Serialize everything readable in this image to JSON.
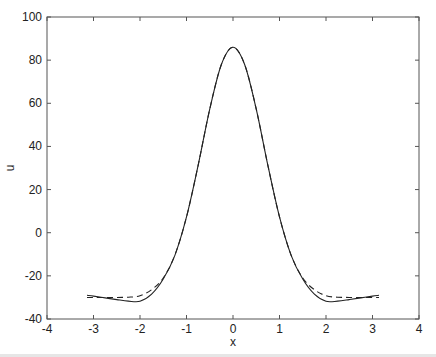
{
  "chart_data": {
    "type": "line",
    "title": "",
    "xlabel": "x",
    "ylabel": "u",
    "xlim": [
      -4,
      4
    ],
    "ylim": [
      -40,
      100
    ],
    "xticks": [
      -4,
      -3,
      -2,
      -1,
      0,
      1,
      2,
      3,
      4
    ],
    "yticks": [
      -40,
      -20,
      0,
      20,
      40,
      60,
      80,
      100
    ],
    "xtick_labels": [
      "-4",
      "-3",
      "-2",
      "-1",
      "0",
      "1",
      "2",
      "3",
      "4"
    ],
    "ytick_labels": [
      "-40",
      "-20",
      "0",
      "20",
      "40",
      "60",
      "80",
      "100"
    ],
    "grid": false,
    "legend": null,
    "x": [
      -3.14,
      -3.0,
      -2.75,
      -2.5,
      -2.25,
      -2.0,
      -1.75,
      -1.5,
      -1.25,
      -1.0,
      -0.75,
      -0.5,
      -0.25,
      0.0,
      0.25,
      0.5,
      0.75,
      1.0,
      1.25,
      1.5,
      1.75,
      2.0,
      2.25,
      2.5,
      2.75,
      3.0,
      3.14
    ],
    "series": [
      {
        "name": "solid",
        "style": "solid",
        "color": "#222222",
        "values": [
          -29.0,
          -29.4,
          -30.2,
          -31.0,
          -31.7,
          -31.8,
          -28.5,
          -21.5,
          -10.5,
          7.3,
          31.2,
          57.3,
          78.0,
          86.0,
          78.0,
          57.3,
          31.2,
          7.3,
          -10.5,
          -21.5,
          -28.5,
          -31.8,
          -31.7,
          -31.0,
          -30.2,
          -29.4,
          -29.0
        ]
      },
      {
        "name": "dashed",
        "style": "dashed",
        "color": "#222222",
        "values": [
          -30.0,
          -30.0,
          -30.0,
          -30.0,
          -29.9,
          -29.2,
          -26.4,
          -21.0,
          -10.4,
          7.3,
          31.2,
          57.3,
          78.0,
          86.0,
          78.0,
          57.3,
          31.2,
          7.3,
          -10.4,
          -21.0,
          -26.4,
          -29.2,
          -29.9,
          -30.0,
          -30.0,
          -30.0,
          -30.0
        ]
      }
    ]
  }
}
